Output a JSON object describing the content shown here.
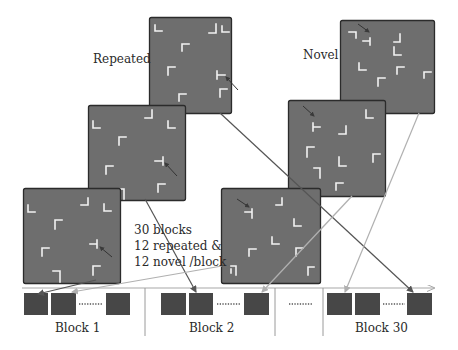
{
  "labels": {
    "repeated": "Repeated",
    "novel": "Novel"
  },
  "note": {
    "line1": "30 blocks",
    "line2": "12 repeated  &",
    "line3": "12 novel /block"
  },
  "timeline": {
    "blocks": [
      {
        "label": "Block 1"
      },
      {
        "label": "Block 2"
      },
      {
        "label": "Block 30"
      }
    ],
    "ellipsis": "........"
  },
  "colors": {
    "panel_fill": "#6e6e6e",
    "panel_border": "#2b2b2b",
    "glyph": "#f2f2f2",
    "trial_box": "#474747",
    "repeated_arrow": "#555555",
    "novel_arrow": "#b0b0b0",
    "timeline_line": "#a8a8a8",
    "divider": "#9a9a9a"
  },
  "panels": {
    "repeated": [
      {
        "id": "repeated-1",
        "x": 149,
        "y": 17,
        "w": 82,
        "h": 96
      },
      {
        "id": "repeated-2",
        "x": 88,
        "y": 105,
        "w": 97,
        "h": 95
      },
      {
        "id": "repeated-3",
        "x": 23,
        "y": 188,
        "w": 97,
        "h": 95
      }
    ],
    "novel": [
      {
        "id": "novel-1",
        "x": 340,
        "y": 20,
        "w": 94,
        "h": 93
      },
      {
        "id": "novel-2",
        "x": 288,
        "y": 100,
        "w": 97,
        "h": 96
      },
      {
        "id": "novel-3",
        "x": 221,
        "y": 188,
        "w": 99,
        "h": 95
      }
    ]
  }
}
